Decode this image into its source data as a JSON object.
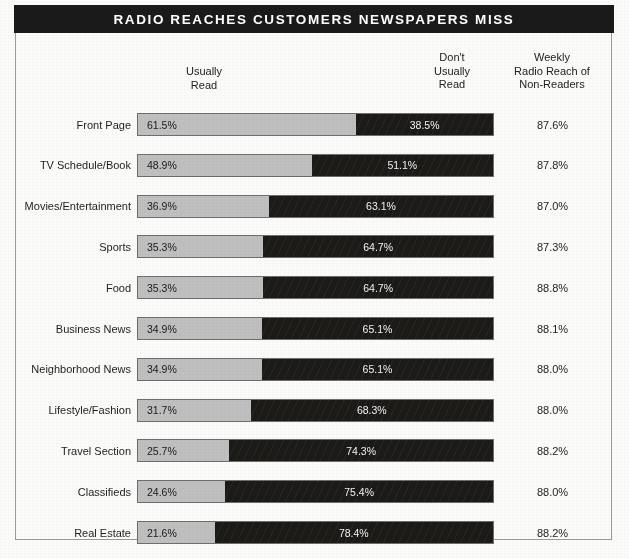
{
  "title": "RADIO REACHES CUSTOMERS NEWSPAPERS MISS",
  "headers": {
    "usually_read": "Usually\nRead",
    "dont_usually_read": "Don't\nUsually\nRead",
    "weekly_reach": "Weekly\nRadio Reach of\nNon-Readers"
  },
  "colors": {
    "banner_background": "#1a1a1a",
    "banner_text": "#ffffff",
    "usually_read_bar": "#bfbfbf",
    "dont_usually_read_bar": "#1c1a17",
    "page_background": "#fbfbf9",
    "frame_border": "#9a9a9a"
  },
  "chart_data": {
    "type": "bar",
    "title": "RADIO REACHES CUSTOMERS NEWSPAPERS MISS",
    "xlabel": "",
    "ylabel": "",
    "orientation": "horizontal",
    "stacked": true,
    "grid": false,
    "legend_position": "top",
    "xlim": [
      0,
      100
    ],
    "categories": [
      "Front Page",
      "TV Schedule/Book",
      "Movies/Entertainment",
      "Sports",
      "Food",
      "Business News",
      "Neighborhood News",
      "Lifestyle/Fashion",
      "Travel Section",
      "Classifieds",
      "Real Estate"
    ],
    "series": [
      {
        "name": "Usually Read",
        "values": [
          61.5,
          48.9,
          36.9,
          35.3,
          35.3,
          34.9,
          34.9,
          31.7,
          25.7,
          24.6,
          21.6
        ],
        "labels": [
          "61.5%",
          "48.9%",
          "36.9%",
          "35.3%",
          "35.3%",
          "34.9%",
          "34.9%",
          "31.7%",
          "25.7%",
          "24.6%",
          "21.6%"
        ],
        "color": "#bfbfbf"
      },
      {
        "name": "Don't Usually Read",
        "values": [
          38.5,
          51.1,
          63.1,
          64.7,
          64.7,
          65.1,
          65.1,
          68.3,
          74.3,
          75.4,
          78.4
        ],
        "labels": [
          "38.5%",
          "51.1%",
          "63.1%",
          "64.7%",
          "64.7%",
          "65.1%",
          "65.1%",
          "68.3%",
          "74.3%",
          "75.4%",
          "78.4%"
        ],
        "color": "#1c1a17"
      },
      {
        "name": "Weekly Radio Reach of Non-Readers",
        "values": [
          87.6,
          87.8,
          87.0,
          87.3,
          88.8,
          88.1,
          88.0,
          88.0,
          88.2,
          88.0,
          88.2
        ],
        "labels": [
          "87.6%",
          "87.8%",
          "87.0%",
          "87.3%",
          "88.8%",
          "88.1%",
          "88.0%",
          "88.0%",
          "88.2%",
          "88.0%",
          "88.2%"
        ],
        "display": "text-column"
      }
    ]
  }
}
